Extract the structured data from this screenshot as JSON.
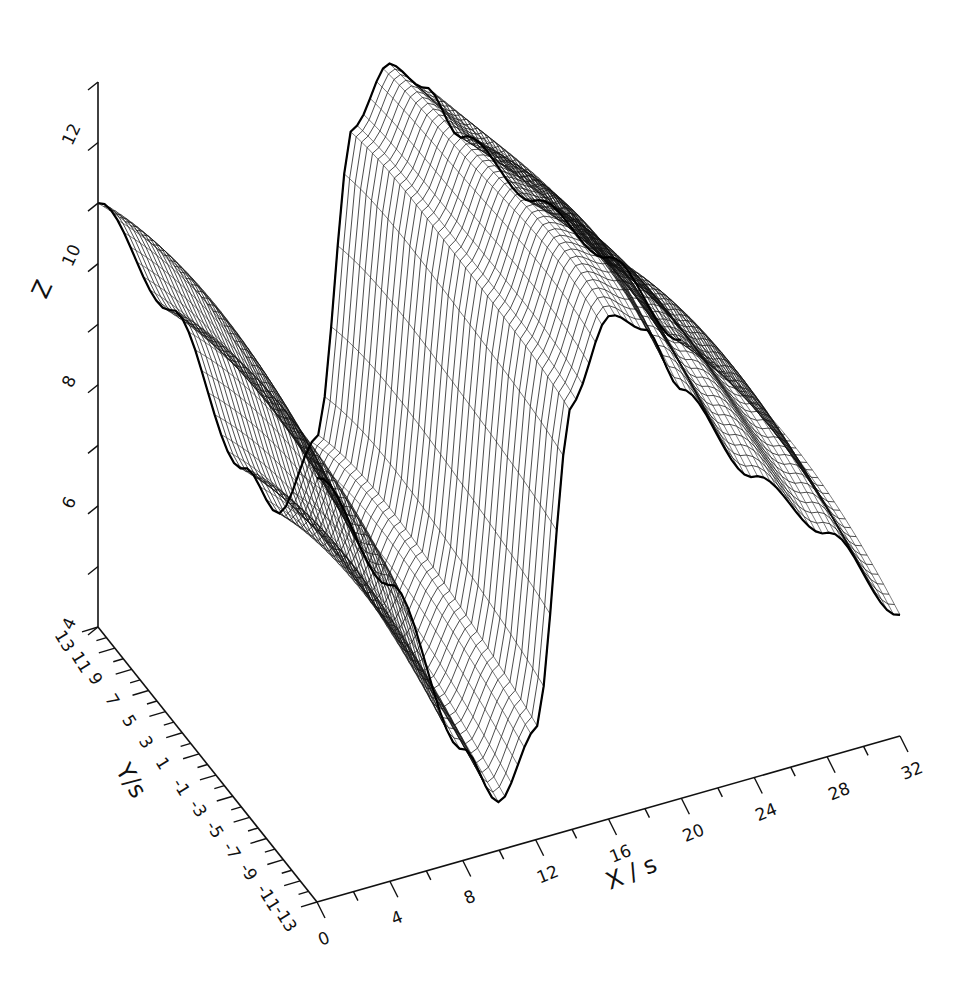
{
  "chart_data": {
    "type": "surface3d",
    "title": "",
    "xlabel": "X / s",
    "ylabel": "Y / s",
    "zlabel": "Z",
    "x_ticks": [
      0,
      4,
      8,
      12,
      16,
      20,
      24,
      28,
      32
    ],
    "y_ticks": [
      13,
      11,
      9,
      7,
      5,
      3,
      1,
      -1,
      -3,
      -5,
      -7,
      -9,
      -11,
      -13
    ],
    "z_ticks": [
      4,
      6,
      8,
      10,
      12
    ],
    "xlim": [
      0,
      32
    ],
    "ylim": [
      -13,
      13
    ],
    "zlim": [
      4,
      13
    ],
    "grid": false,
    "style": "wireframe mesh, black on white",
    "surface_profile_along_x": {
      "x": [
        0,
        4,
        8,
        10,
        12,
        14,
        16,
        18,
        20,
        24,
        28,
        32
      ],
      "z_approx": [
        11.6,
        9.5,
        6.5,
        5.5,
        6.5,
        11.5,
        12.6,
        12.2,
        11.2,
        9.6,
        8.3,
        6.6
      ]
    }
  },
  "axes": {
    "z": {
      "label": "Z",
      "ticks": [
        "4",
        "6",
        "8",
        "10",
        "12"
      ]
    },
    "y": {
      "label": "Y/s",
      "ticks": [
        "13",
        "11",
        "9",
        "7",
        "5",
        "3",
        "1",
        "-1",
        "-3",
        "-5",
        "-7",
        "-9",
        "-11",
        "-13"
      ]
    },
    "x": {
      "label": "X / s",
      "ticks": [
        "0",
        "4",
        "8",
        "12",
        "16",
        "20",
        "24",
        "28",
        "32"
      ]
    }
  }
}
